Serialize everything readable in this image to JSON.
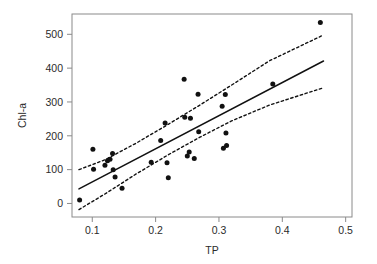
{
  "figure": {
    "background_color": "#ffffff",
    "point_color": "#111111",
    "line_color": "#111111",
    "axis_color": "#8a8a8a",
    "panel": {
      "left": 72,
      "right": 352,
      "top": 14,
      "bottom": 217
    }
  },
  "chart_data": {
    "type": "scatter",
    "title": "",
    "subtitle": "",
    "xlabel": "TP",
    "ylabel": "Chl-a",
    "xlim": [
      0.068,
      0.51
    ],
    "ylim": [
      -40,
      560
    ],
    "grid": false,
    "legend": "none",
    "xticks": [
      0.1,
      0.2,
      0.3,
      0.4,
      0.5
    ],
    "xtick_labels": [
      "0.1",
      "0.2",
      "0.3",
      "0.4",
      "0.5"
    ],
    "yticks": [
      0,
      100,
      200,
      300,
      400,
      500
    ],
    "ytick_labels": [
      "0",
      "100",
      "200",
      "300",
      "400",
      "500"
    ],
    "points": [
      {
        "x": 0.08,
        "y": 10
      },
      {
        "x": 0.101,
        "y": 160
      },
      {
        "x": 0.102,
        "y": 101
      },
      {
        "x": 0.12,
        "y": 113
      },
      {
        "x": 0.124,
        "y": 126
      },
      {
        "x": 0.128,
        "y": 131
      },
      {
        "x": 0.132,
        "y": 148
      },
      {
        "x": 0.133,
        "y": 100
      },
      {
        "x": 0.136,
        "y": 78
      },
      {
        "x": 0.147,
        "y": 45
      },
      {
        "x": 0.193,
        "y": 122
      },
      {
        "x": 0.208,
        "y": 186
      },
      {
        "x": 0.215,
        "y": 238
      },
      {
        "x": 0.218,
        "y": 120
      },
      {
        "x": 0.22,
        "y": 76
      },
      {
        "x": 0.245,
        "y": 367
      },
      {
        "x": 0.246,
        "y": 255
      },
      {
        "x": 0.25,
        "y": 140
      },
      {
        "x": 0.253,
        "y": 152
      },
      {
        "x": 0.255,
        "y": 252
      },
      {
        "x": 0.261,
        "y": 133
      },
      {
        "x": 0.267,
        "y": 323
      },
      {
        "x": 0.268,
        "y": 212
      },
      {
        "x": 0.305,
        "y": 287
      },
      {
        "x": 0.307,
        "y": 163
      },
      {
        "x": 0.31,
        "y": 322
      },
      {
        "x": 0.311,
        "y": 208
      },
      {
        "x": 0.312,
        "y": 171
      },
      {
        "x": 0.385,
        "y": 353
      },
      {
        "x": 0.46,
        "y": 535
      }
    ],
    "fit_line": {
      "name": "regression line",
      "style": "solid",
      "x_start": 0.079,
      "y_start": 43,
      "x_end": 0.465,
      "y_end": 421
    },
    "confidence_bands": [
      {
        "name": "upper confidence band",
        "style": "dashed",
        "points": [
          {
            "x": 0.079,
            "y": 100
          },
          {
            "x": 0.12,
            "y": 129
          },
          {
            "x": 0.17,
            "y": 179
          },
          {
            "x": 0.22,
            "y": 234
          },
          {
            "x": 0.27,
            "y": 291
          },
          {
            "x": 0.32,
            "y": 350
          },
          {
            "x": 0.38,
            "y": 422
          },
          {
            "x": 0.465,
            "y": 498
          }
        ]
      },
      {
        "name": "lower confidence band",
        "style": "dashed",
        "points": [
          {
            "x": 0.079,
            "y": -18
          },
          {
            "x": 0.12,
            "y": 28
          },
          {
            "x": 0.17,
            "y": 88
          },
          {
            "x": 0.22,
            "y": 144
          },
          {
            "x": 0.27,
            "y": 196
          },
          {
            "x": 0.32,
            "y": 244
          },
          {
            "x": 0.38,
            "y": 291
          },
          {
            "x": 0.465,
            "y": 342
          }
        ]
      }
    ]
  }
}
